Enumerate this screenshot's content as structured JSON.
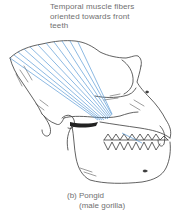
{
  "annotation": {
    "lines": [
      "Temporal muscle fibers",
      "oriented towards front",
      "teeth"
    ]
  },
  "caption": {
    "letter": "(b)",
    "line1": "Pongid",
    "line2": "(male gorilla)"
  },
  "colors": {
    "muscle_fibers": "#5b9bd5",
    "line_art": "#333333",
    "background": "#ffffff"
  }
}
